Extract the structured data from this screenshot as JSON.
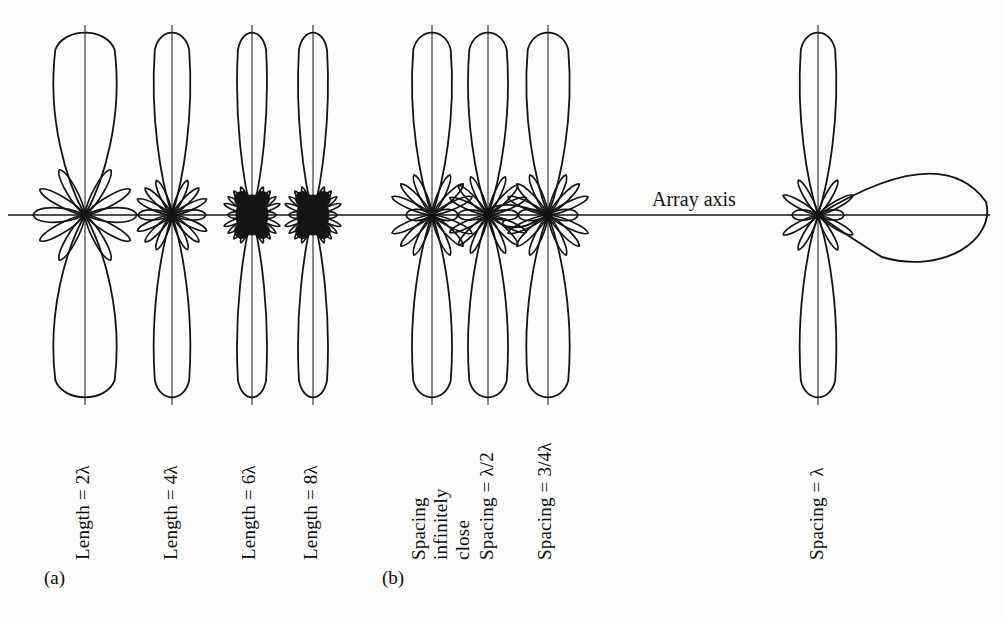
{
  "figure": {
    "background_color": "#fdfdfd",
    "stroke_color": "#141414",
    "annotations": {
      "array_axis": "Array axis"
    },
    "panels": [
      {
        "id": "a",
        "label": "(a)",
        "label_x": 44,
        "label_y": 567,
        "patterns": [
          {
            "label": "Length = 2λ",
            "label_x": 72,
            "label_y": 560,
            "cx": 85,
            "cy": 215,
            "main_lobe_half_length": 188,
            "main_lobe_half_width": 38,
            "side_lobes": 8,
            "side_lobe_length": 52,
            "side_lobe_width": 13,
            "dense_cluster": false,
            "horizontal_lobe_length": 52
          },
          {
            "label": "Length = 4λ",
            "label_x": 160,
            "label_y": 560,
            "cx": 172,
            "cy": 215,
            "main_lobe_half_length": 188,
            "main_lobe_half_width": 22,
            "side_lobes": 10,
            "side_lobe_length": 38,
            "side_lobe_width": 9,
            "dense_cluster": false,
            "horizontal_lobe_length": 34
          },
          {
            "label": "Length = 6λ",
            "label_x": 238,
            "label_y": 560,
            "cx": 252,
            "cy": 215,
            "main_lobe_half_length": 188,
            "main_lobe_half_width": 18,
            "side_lobes": 14,
            "side_lobe_length": 30,
            "side_lobe_width": 6,
            "dense_cluster": true,
            "horizontal_lobe_length": 24
          },
          {
            "label": "Length = 8λ",
            "label_x": 300,
            "label_y": 560,
            "cx": 313,
            "cy": 215,
            "main_lobe_half_length": 188,
            "main_lobe_half_width": 18,
            "side_lobes": 16,
            "side_lobe_length": 30,
            "side_lobe_width": 6,
            "dense_cluster": true,
            "horizontal_lobe_length": 24
          }
        ]
      },
      {
        "id": "b",
        "label": "(b)",
        "label_x": 382,
        "label_y": 567,
        "patterns": [
          {
            "label": "Spacing\ninfinitely\nclose",
            "label_lines": [
              "Spacing",
              "infinitely",
              "close"
            ],
            "label_x": 408,
            "label_y": 560,
            "cx": 432,
            "cy": 215,
            "main_lobe_half_length": 188,
            "main_lobe_half_width": 24,
            "side_lobes": 10,
            "side_lobe_length": 44,
            "side_lobe_width": 10,
            "dense_cluster": false,
            "horizontal_lobe_length": 26,
            "big_side_lobe": null
          },
          {
            "label": "Spacing = λ/2",
            "label_x": 476,
            "label_y": 560,
            "cx": 488,
            "cy": 215,
            "main_lobe_half_length": 188,
            "main_lobe_half_width": 24,
            "side_lobes": 12,
            "side_lobe_length": 42,
            "side_lobe_width": 9,
            "dense_cluster": false,
            "horizontal_lobe_length": 30,
            "big_side_lobe": null
          },
          {
            "label": "Spacing = 3/4λ",
            "label_x": 534,
            "label_y": 560,
            "cx": 548,
            "cy": 215,
            "main_lobe_half_length": 188,
            "main_lobe_half_width": 26,
            "side_lobes": 12,
            "side_lobe_length": 44,
            "side_lobe_width": 10,
            "dense_cluster": false,
            "horizontal_lobe_length": 30,
            "big_side_lobe": {
              "direction": "left",
              "length": 58,
              "width": 30
            }
          },
          {
            "label": "Spacing = λ",
            "label_x": 806,
            "label_y": 560,
            "cx": 818,
            "cy": 215,
            "main_lobe_half_length": 188,
            "main_lobe_half_width": 22,
            "side_lobes": 8,
            "side_lobe_length": 40,
            "side_lobe_width": 9,
            "dense_cluster": false,
            "horizontal_lobe_length": 26,
            "big_side_lobe": {
              "direction": "right",
              "length": 168,
              "width": 120
            }
          }
        ]
      }
    ],
    "axis": {
      "y": 215,
      "x_start": 8,
      "x_end": 990
    }
  }
}
